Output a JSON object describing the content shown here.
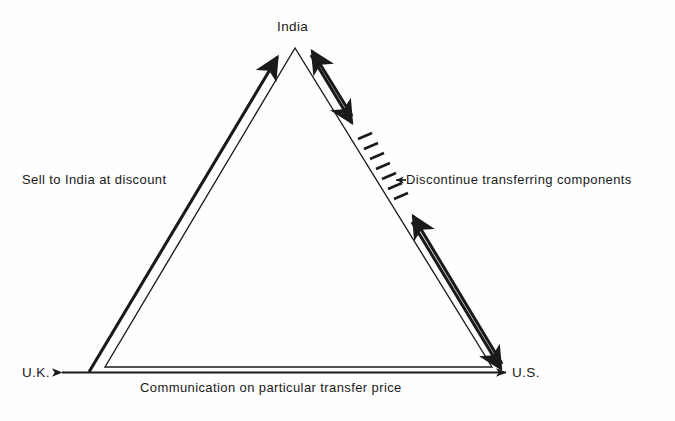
{
  "diagram": {
    "type": "triangle-flow-diagram",
    "nodes": [
      {
        "id": "india",
        "label": "India",
        "position": "apex-top"
      },
      {
        "id": "uk",
        "label": "U.K.",
        "position": "bottom-left"
      },
      {
        "id": "us",
        "label": "U.S.",
        "position": "bottom-right"
      }
    ],
    "edges": [
      {
        "id": "uk-to-india",
        "label": "Sell to India at discount",
        "from": "U.K.",
        "to": "India",
        "direction": "one-way",
        "style": "thick-arrow"
      },
      {
        "id": "india-us",
        "label": "Discontinue transferring components",
        "from": "India",
        "to": "U.S.",
        "direction": "two-way",
        "style": "thick-arrow-crossed-out",
        "annotation": "hash-marks-strikethrough"
      },
      {
        "id": "uk-us",
        "label": "Communication on particular transfer price",
        "from": "U.K.",
        "to": "U.S.",
        "direction": "two-way",
        "style": "thin-double-arrow"
      }
    ],
    "colors": {
      "ink": "#1a1a1a",
      "background": "#fefefe"
    }
  }
}
